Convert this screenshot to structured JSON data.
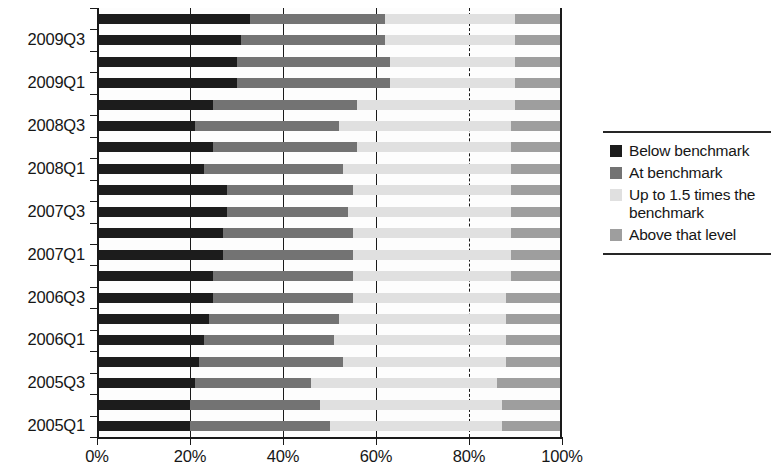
{
  "chart_data": {
    "type": "bar",
    "orientation": "horizontal",
    "stacked": true,
    "stack_mode": "percent",
    "title": "",
    "subtitle": "",
    "xlabel": "",
    "ylabel": "",
    "xlim": [
      0,
      100
    ],
    "xticks": [
      0,
      20,
      40,
      60,
      80,
      100
    ],
    "xtick_labels": [
      "0%",
      "20%",
      "40%",
      "60%",
      "80%",
      "100%"
    ],
    "grid": true,
    "gridlines_x": [
      20,
      40,
      60,
      80
    ],
    "gridline_styles": [
      "solid",
      "solid",
      "solid",
      "dashed"
    ],
    "legend_position": "right",
    "categories": [
      "2009Q4",
      "2009Q3",
      "2009Q2",
      "2009Q1",
      "2008Q4",
      "2008Q3",
      "2008Q2",
      "2008Q1",
      "2007Q4",
      "2007Q3",
      "2007Q2",
      "2007Q1",
      "2006Q4",
      "2006Q3",
      "2006Q2",
      "2006Q1",
      "2005Q4",
      "2005Q3",
      "2005Q2",
      "2005Q1"
    ],
    "visible_tick_labels": [
      "2009Q3",
      "2009Q1",
      "2008Q3",
      "2008Q1",
      "2007Q3",
      "2007Q1",
      "2006Q3",
      "2006Q1",
      "2005Q3",
      "2005Q1"
    ],
    "series": [
      {
        "name": "Below benchmark",
        "color": "#1c1c1c",
        "values": [
          33,
          31,
          30,
          30,
          25,
          21,
          25,
          23,
          28,
          28,
          27,
          27,
          25,
          25,
          24,
          23,
          22,
          21,
          20,
          20
        ]
      },
      {
        "name": "At benchmark",
        "color": "#737373",
        "values": [
          29,
          31,
          33,
          33,
          31,
          31,
          31,
          30,
          27,
          26,
          28,
          28,
          30,
          30,
          28,
          28,
          31,
          25,
          28,
          30
        ]
      },
      {
        "name": "Up to 1.5 times the benchmark",
        "color": "#e0e0e0",
        "values": [
          28,
          28,
          27,
          27,
          34,
          37,
          33,
          36,
          34,
          35,
          34,
          34,
          34,
          33,
          36,
          37,
          35,
          40,
          39,
          37
        ]
      },
      {
        "name": "Above that level",
        "color": "#9e9e9e",
        "values": [
          10,
          10,
          10,
          10,
          10,
          11,
          11,
          11,
          11,
          11,
          11,
          11,
          11,
          12,
          12,
          12,
          12,
          14,
          13,
          13
        ]
      }
    ]
  },
  "legend": {
    "items": [
      {
        "label": "Below benchmark",
        "color": "#1c1c1c"
      },
      {
        "label": "At benchmark",
        "color": "#737373"
      },
      {
        "label": "Up to 1.5 times the benchmark",
        "color": "#e0e0e0"
      },
      {
        "label": "Above that level",
        "color": "#9e9e9e"
      }
    ]
  },
  "axis": {
    "x_tick_labels": [
      "0%",
      "20%",
      "40%",
      "60%",
      "80%",
      "100%"
    ],
    "y_tick_labels": [
      "2009Q3",
      "2009Q1",
      "2008Q3",
      "2008Q1",
      "2007Q3",
      "2007Q1",
      "2006Q3",
      "2006Q1",
      "2005Q3",
      "2005Q1"
    ]
  }
}
